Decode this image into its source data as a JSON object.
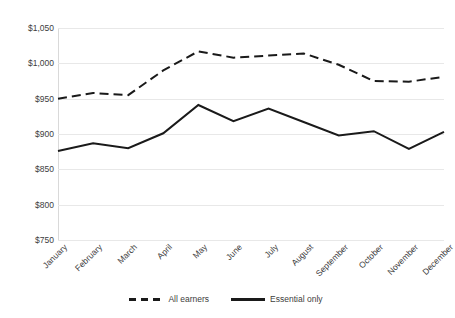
{
  "chart_data": {
    "type": "line",
    "title": "",
    "subtitle": "",
    "xlabel": "",
    "ylabel": "",
    "categories": [
      "January",
      "February",
      "March",
      "April",
      "May",
      "June",
      "July",
      "August",
      "September",
      "October",
      "November",
      "December"
    ],
    "series": [
      {
        "name": "All earners",
        "style": "dashed",
        "color": "#1a1a1a",
        "values": [
          950,
          958,
          955,
          990,
          1017,
          1008,
          1011,
          1014,
          998,
          975,
          974,
          981
        ]
      },
      {
        "name": "Essential only",
        "style": "solid",
        "color": "#1a1a1a",
        "values": [
          876,
          887,
          880,
          901,
          941,
          918,
          936,
          917,
          898,
          904,
          879,
          903
        ]
      }
    ],
    "ylim": [
      750,
      1050
    ],
    "ytick_values": [
      750,
      800,
      850,
      900,
      950,
      1000,
      1050
    ],
    "ytick_labels": [
      "$750",
      "$800",
      "$850",
      "$900",
      "$950",
      "$1,000",
      "$1,050"
    ],
    "grid": true,
    "grid_color": "#e8e8e8",
    "legend_position": "bottom"
  }
}
